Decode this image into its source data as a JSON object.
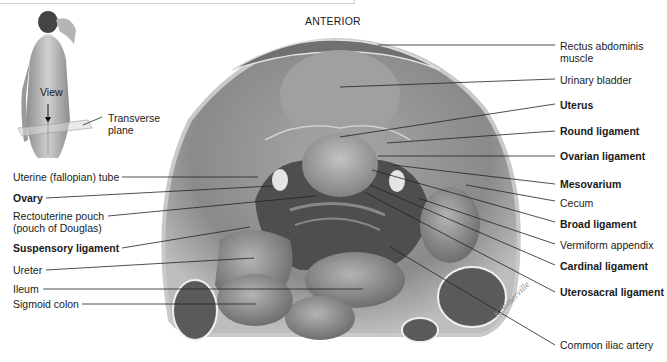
{
  "orientation_label": "ANTERIOR",
  "inset": {
    "view_label": "View",
    "plane_label_line1": "Transverse",
    "plane_label_line2": "plane"
  },
  "left_labels": [
    {
      "text": "Uterine (fallopian) tube",
      "bold": false
    },
    {
      "text": "Ovary",
      "bold": true
    },
    {
      "text": "Rectouterine pouch",
      "bold": false
    },
    {
      "text": "(pouch of Douglas)",
      "bold": false
    },
    {
      "text": "Suspensory ligament",
      "bold": true
    },
    {
      "text": "Ureter",
      "bold": false
    },
    {
      "text": "Ileum",
      "bold": false
    },
    {
      "text": "Sigmoid colon",
      "bold": false
    }
  ],
  "right_labels": [
    {
      "text": "Rectus abdominis",
      "bold": false
    },
    {
      "text": "muscle",
      "bold": false
    },
    {
      "text": "Urinary bladder",
      "bold": false
    },
    {
      "text": "Uterus",
      "bold": true
    },
    {
      "text": "Round ligament",
      "bold": true
    },
    {
      "text": "Ovarian ligament",
      "bold": true
    },
    {
      "text": "Mesovarium",
      "bold": true
    },
    {
      "text": "Cecum",
      "bold": false
    },
    {
      "text": "Broad ligament",
      "bold": true
    },
    {
      "text": "Vermiform appendix",
      "bold": false
    },
    {
      "text": "Cardinal ligament",
      "bold": true
    },
    {
      "text": "Uterosacral ligament",
      "bold": true
    },
    {
      "text": "Common iliac artery",
      "bold": false
    }
  ],
  "signature": "K.Somerville",
  "colors": {
    "background": "#ffffff",
    "text": "#1a1a1a",
    "leader": "#222222",
    "tissue_dark": "#6a6a6a",
    "tissue_mid": "#9a9a9a",
    "tissue_light": "#c8c8c8"
  }
}
